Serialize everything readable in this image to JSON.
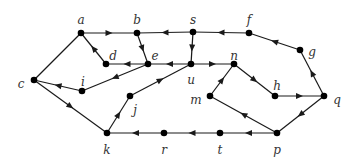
{
  "diagram": {
    "type": "directed-graph",
    "colors": {
      "edge": "#1a1a1a",
      "node": "#000000",
      "label": "#333333"
    },
    "nodes": [
      {
        "id": "a",
        "x": 81,
        "y": 33,
        "lx": 81,
        "ly": 20
      },
      {
        "id": "b",
        "x": 137,
        "y": 33,
        "lx": 137,
        "ly": 20
      },
      {
        "id": "s",
        "x": 193,
        "y": 32,
        "lx": 193,
        "ly": 20
      },
      {
        "id": "f",
        "x": 249,
        "y": 33,
        "lx": 249,
        "ly": 20
      },
      {
        "id": "g",
        "x": 300,
        "y": 50,
        "lx": 312,
        "ly": 52
      },
      {
        "id": "d",
        "x": 106,
        "y": 64,
        "lx": 113,
        "ly": 56
      },
      {
        "id": "e",
        "x": 148,
        "y": 64,
        "lx": 155,
        "ly": 56
      },
      {
        "id": "u",
        "x": 191,
        "y": 64,
        "lx": 191,
        "ly": 80
      },
      {
        "id": "n",
        "x": 234,
        "y": 64,
        "lx": 234,
        "ly": 56
      },
      {
        "id": "c",
        "x": 34,
        "y": 80,
        "lx": 21,
        "ly": 84
      },
      {
        "id": "i",
        "x": 82,
        "y": 91,
        "lx": 83,
        "ly": 82
      },
      {
        "id": "m",
        "x": 210,
        "y": 96,
        "lx": 196,
        "ly": 100
      },
      {
        "id": "h",
        "x": 275,
        "y": 96,
        "lx": 277,
        "ly": 86
      },
      {
        "id": "q",
        "x": 324,
        "y": 96,
        "lx": 337,
        "ly": 100
      },
      {
        "id": "j",
        "x": 130,
        "y": 96,
        "lx": 135,
        "ly": 110
      },
      {
        "id": "k",
        "x": 107,
        "y": 133,
        "lx": 107,
        "ly": 150
      },
      {
        "id": "r",
        "x": 164,
        "y": 133,
        "lx": 164,
        "ly": 150
      },
      {
        "id": "t",
        "x": 220,
        "y": 133,
        "lx": 220,
        "ly": 150
      },
      {
        "id": "p",
        "x": 277,
        "y": 133,
        "lx": 277,
        "ly": 150
      }
    ],
    "edges": [
      {
        "from": "a",
        "to": "b",
        "directed": true
      },
      {
        "from": "s",
        "to": "b",
        "directed": true
      },
      {
        "from": "f",
        "to": "s",
        "directed": true
      },
      {
        "from": "g",
        "to": "f",
        "directed": true
      },
      {
        "from": "q",
        "to": "g",
        "directed": true
      },
      {
        "from": "h",
        "to": "q",
        "directed": true
      },
      {
        "from": "n",
        "to": "h",
        "directed": true
      },
      {
        "from": "m",
        "to": "n",
        "directed": true
      },
      {
        "from": "p",
        "to": "m",
        "directed": true
      },
      {
        "from": "q",
        "to": "p",
        "directed": true
      },
      {
        "from": "p",
        "to": "t",
        "directed": true
      },
      {
        "from": "t",
        "to": "r",
        "directed": true
      },
      {
        "from": "r",
        "to": "k",
        "directed": true
      },
      {
        "from": "c",
        "to": "k",
        "directed": true
      },
      {
        "from": "k",
        "to": "j",
        "directed": true
      },
      {
        "from": "j",
        "to": "u",
        "directed": true
      },
      {
        "from": "u",
        "to": "n",
        "directed": true
      },
      {
        "from": "s",
        "to": "u",
        "directed": true
      },
      {
        "from": "u",
        "to": "e",
        "directed": true
      },
      {
        "from": "b",
        "to": "e",
        "directed": true
      },
      {
        "from": "e",
        "to": "d",
        "directed": true
      },
      {
        "from": "d",
        "to": "a",
        "directed": true
      },
      {
        "from": "a",
        "to": "c",
        "directed": false
      },
      {
        "from": "e",
        "to": "i",
        "directed": true
      },
      {
        "from": "i",
        "to": "c",
        "directed": true
      }
    ]
  }
}
